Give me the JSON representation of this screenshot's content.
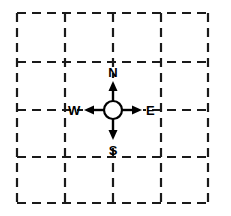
{
  "diagram": {
    "background_color": "#ffffff",
    "line_color": "#1a1a1a",
    "compass_color": "#000000",
    "grid": {
      "rows": 4,
      "cols": 4,
      "x_lines": [
        17,
        65,
        113,
        161,
        208
      ],
      "y_lines": [
        13,
        62,
        110,
        157,
        203
      ],
      "dash": "9 6",
      "stroke_width": 2.2
    },
    "compass": {
      "center_x": 113,
      "center_y": 110,
      "radius": 9,
      "arrow_length": 28,
      "labels": {
        "north": "N",
        "east": "E",
        "south": "S",
        "west": "W"
      },
      "label_positions": {
        "north": {
          "x": 113,
          "y": 77
        },
        "east": {
          "x": 146,
          "y": 115
        },
        "south": {
          "x": 113,
          "y": 155
        },
        "west": {
          "x": 68,
          "y": 115
        }
      }
    }
  }
}
